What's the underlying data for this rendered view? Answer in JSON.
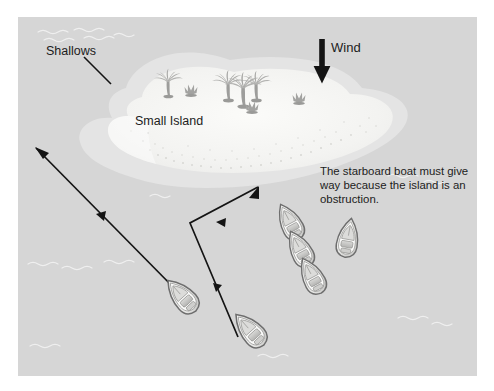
{
  "diagram": {
    "labels": {
      "shallows": "Shallows",
      "small_island": "Small Island",
      "wind": "Wind"
    },
    "note": "The starboard boat must give way because the island is an obstruction.",
    "colors": {
      "water": "#d6d6d6",
      "shallows": "#e3e3e3",
      "sand": "#f2f2f0",
      "sand_inner": "#fafaf8",
      "boat_light": "#f4f4f2",
      "boat_mid": "#c9c9c7",
      "boat_outline": "#6e6e6e",
      "palm": "#a8a8a6",
      "arrow": "#141414",
      "text": "#1c1c1c",
      "page": "#ffffff",
      "wave": "#ffffff"
    },
    "frame": {
      "x": 18,
      "y": 17,
      "width": 459,
      "height": 359
    },
    "wind_arrow": {
      "x": 322,
      "y_start": 39,
      "y_end": 83,
      "direction": "down"
    },
    "shallows_leader": {
      "x1": 84,
      "y1": 57,
      "x2": 110,
      "y2": 83
    },
    "tracks": [
      {
        "name": "port-boat-track",
        "points": "238,337 190,223 258,187",
        "arrowheads": 3
      },
      {
        "name": "starboard-boat-track",
        "points": "179,293 36,148",
        "arrowheads": 2
      }
    ],
    "boats": [
      {
        "name": "boat-lower-left",
        "x": 182,
        "y": 296,
        "rotation": -42,
        "scale": 1.0
      },
      {
        "name": "boat-lower-right",
        "x": 250,
        "y": 330,
        "rotation": -42,
        "scale": 1.0
      },
      {
        "name": "boat-fleet-top",
        "x": 290,
        "y": 222,
        "rotation": -28,
        "scale": 0.95
      },
      {
        "name": "boat-fleet-mid",
        "x": 300,
        "y": 249,
        "rotation": -28,
        "scale": 0.95
      },
      {
        "name": "boat-fleet-low",
        "x": 312,
        "y": 276,
        "rotation": -28,
        "scale": 0.95
      },
      {
        "name": "boat-starboard",
        "x": 348,
        "y": 238,
        "rotation": 10,
        "scale": 0.95
      }
    ],
    "palms": [
      {
        "name": "palm-left",
        "x": 168,
        "y": 96,
        "scale": 0.8
      },
      {
        "name": "palm-center-back",
        "x": 228,
        "y": 100,
        "scale": 0.88
      },
      {
        "name": "palm-center-front",
        "x": 243,
        "y": 106,
        "scale": 1.0
      },
      {
        "name": "palm-center-right",
        "x": 256,
        "y": 100,
        "scale": 0.86
      }
    ],
    "bushes": [
      {
        "name": "bush-left",
        "x": 191,
        "y": 95,
        "scale": 1.0
      },
      {
        "name": "bush-center",
        "x": 252,
        "y": 112,
        "scale": 1.0
      },
      {
        "name": "bush-right",
        "x": 299,
        "y": 103,
        "scale": 1.0
      }
    ]
  }
}
